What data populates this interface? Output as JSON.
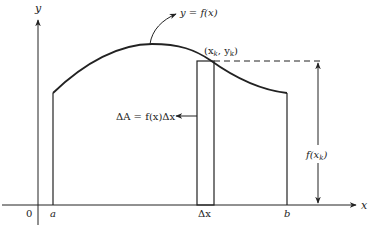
{
  "diagram": {
    "colors": {
      "stroke": "#222222",
      "background": "#ffffff"
    },
    "axes": {
      "x_label": "x",
      "y_label": "y",
      "origin_label": "0"
    },
    "labels": {
      "curve": "y = f(x)",
      "point": "(x_k, y_k)",
      "point_display": "(x",
      "point_sub1": "k",
      "point_mid": ", y",
      "point_sub2": "k",
      "point_end": ")",
      "area": "ΔA = f(x)Δx",
      "height_f": "f(x",
      "height_sub": "k",
      "height_end": ")",
      "a": "a",
      "b": "b",
      "dx": "Δx"
    }
  }
}
